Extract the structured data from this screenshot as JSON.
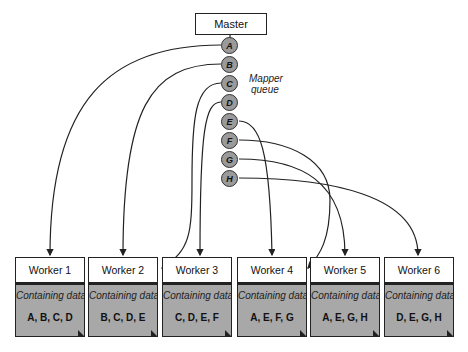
{
  "diagram": {
    "master_label": "Master",
    "queue_label": "Mapper queue",
    "queue_label_lines": [
      "Mapper",
      "queue"
    ],
    "queue": [
      "A",
      "B",
      "C",
      "D",
      "E",
      "F",
      "G",
      "H"
    ],
    "caption_common": "Containing data",
    "workers": [
      {
        "label": "Worker 1",
        "caption": "Containing data",
        "data": "A, B, C, D"
      },
      {
        "label": "Worker 2",
        "caption": "Containing data",
        "data": "B, C, D, E"
      },
      {
        "label": "Worker 3",
        "caption": "Containing data",
        "data": "C, D, E, F"
      },
      {
        "label": "Worker 4",
        "caption": "Containing data",
        "data": "A, E, F, G"
      },
      {
        "label": "Worker 5",
        "caption": "Containing data",
        "data": "A, E, G, H"
      },
      {
        "label": "Worker 6",
        "caption": "Containing data",
        "data": "D, E, G, H"
      }
    ],
    "assignments": [
      {
        "from": "A",
        "to": "Worker 1"
      },
      {
        "from": "B",
        "to": "Worker 2"
      },
      {
        "from": "C",
        "to": "Worker 3"
      },
      {
        "from": "D",
        "to": "Worker 3"
      },
      {
        "from": "E",
        "to": "Worker 4"
      },
      {
        "from": "F",
        "to": "Worker 4"
      },
      {
        "from": "G",
        "to": "Worker 5"
      },
      {
        "from": "H",
        "to": "Worker 6"
      }
    ],
    "colors": {
      "node_fill": "#9a9a9a",
      "body_fill": "#a8a8a8",
      "stroke": "#222222"
    }
  }
}
